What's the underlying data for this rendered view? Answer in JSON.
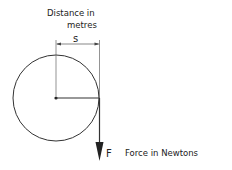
{
  "diagram": {
    "labels": {
      "distance_line1": "Distance in",
      "distance_line2": "metres",
      "distance_symbol": "s",
      "force_symbol": "F",
      "force_description": "Force in Newtons"
    },
    "colors": {
      "stroke": "#333333",
      "text": "#222222"
    }
  }
}
